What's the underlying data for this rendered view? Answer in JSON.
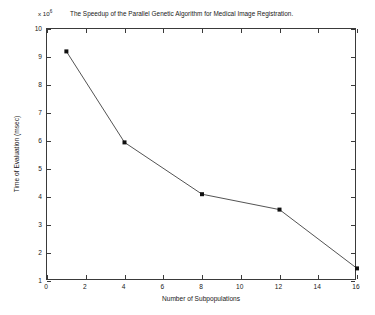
{
  "figure": {
    "background_color": "#ffffff",
    "axis_color": "#3a3a3a",
    "text_color": "#202020"
  },
  "exponent": {
    "prefix": "x 10",
    "power": "6"
  },
  "chart_data": {
    "type": "line",
    "title": "The Speedup of the Parallel Genetic Algorithm for Medical Image Registration.",
    "xlabel": "Number of Subpopulations",
    "ylabel": "Time of Evaluation (msec)",
    "y_exponent_label": "x 10^6",
    "xlim": [
      0,
      16
    ],
    "ylim": [
      1,
      10
    ],
    "xticks": [
      0,
      2,
      4,
      6,
      8,
      10,
      12,
      14,
      16
    ],
    "xtick_labels": [
      "0",
      "2",
      "4",
      "6",
      "8",
      "10",
      "12",
      "14",
      "16"
    ],
    "yticks": [
      1,
      2,
      3,
      4,
      5,
      6,
      7,
      8,
      9,
      10
    ],
    "ytick_labels": [
      "1",
      "2",
      "3",
      "4",
      "5",
      "6",
      "7",
      "8",
      "9",
      "10"
    ],
    "grid": false,
    "legend": null,
    "series": [
      {
        "name": "Time of Evaluation",
        "marker": "square-filled",
        "line_color": "#404040",
        "marker_color": "#101010",
        "x": [
          1,
          4,
          8,
          12,
          16
        ],
        "y": [
          9.2,
          5.95,
          4.1,
          3.55,
          1.45
        ]
      }
    ]
  }
}
